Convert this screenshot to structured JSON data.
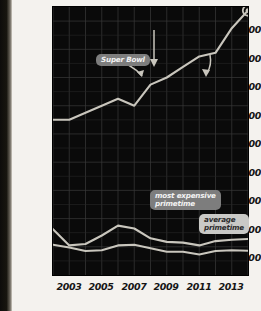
{
  "page": {
    "background_color": "#f4f2ee",
    "plot_background_color": "#0a0a0a",
    "line_color": "#c9c6bd",
    "grid_color": "#3a3a3a"
  },
  "annotations": {
    "super_bowl": "Super Bowl",
    "most_expensive_primetime": "most expensive\nprimetime",
    "average_primetime": "average\nprimetime"
  },
  "chart_data": {
    "type": "line",
    "title": "",
    "xlabel": "",
    "ylabel": "",
    "grid": true,
    "legend": "annotations",
    "xlim": [
      2002,
      2014
    ],
    "ylim": [
      0,
      3800000
    ],
    "x": [
      2002,
      2003,
      2004,
      2005,
      2006,
      2007,
      2008,
      2009,
      2010,
      2011,
      2012,
      2013,
      2014
    ],
    "ytick_labels": [
      "400000",
      "800000",
      "1200000",
      "1600000",
      "2000000",
      "2400000",
      "2800000",
      "3200000",
      "3600000"
    ],
    "ytick_values": [
      400000,
      800000,
      1200000,
      1600000,
      2000000,
      2400000,
      2800000,
      3200000,
      3600000
    ],
    "xtick_labels": [
      "2003",
      "2005",
      "2007",
      "2009",
      "2011",
      "2013"
    ],
    "xtick_values": [
      2003,
      2005,
      2007,
      2009,
      2011,
      2013
    ],
    "series": [
      {
        "name": "Super Bowl",
        "marker_last_point": true,
        "values": [
          2200000,
          2200000,
          2300000,
          2400000,
          2500000,
          2400000,
          2700000,
          2800000,
          2950000,
          3100000,
          3150000,
          3500000,
          3750000
        ]
      },
      {
        "name": "most expensive primetime",
        "values": [
          650000,
          420000,
          440000,
          560000,
          700000,
          660000,
          520000,
          470000,
          460000,
          420000,
          480000,
          500000,
          510000
        ]
      },
      {
        "name": "average primetime",
        "values": [
          430000,
          390000,
          340000,
          350000,
          420000,
          430000,
          380000,
          330000,
          330000,
          290000,
          340000,
          350000,
          345000
        ]
      }
    ]
  }
}
